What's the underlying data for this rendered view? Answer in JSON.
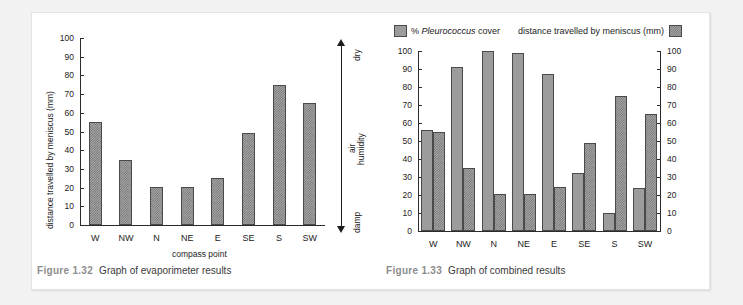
{
  "page": {
    "background_color": "#f2f2f2",
    "card_color": "#ffffff"
  },
  "figures": [
    {
      "id": "figure-1-32",
      "caption_number": "Figure 1.32",
      "caption_text": "Graph of evaporimeter results",
      "humidity_scale": {
        "top_label": "dry",
        "middle_label_line1": "air",
        "middle_label_line2": "humidity",
        "bottom_label": "damp"
      }
    },
    {
      "id": "figure-1-33",
      "caption_number": "Figure 1.33",
      "caption_text": "Graph of combined results",
      "legend": [
        {
          "label_prefix": "% ",
          "label_italic": "Pleurococcus",
          "label_suffix": " cover",
          "swatch": "solid",
          "color": "#9c9c9c"
        },
        {
          "label_prefix": "distance travelled by meniscus (mm)",
          "label_italic": "",
          "label_suffix": "",
          "swatch": "dotted",
          "color": "#a8a8a8"
        }
      ]
    }
  ],
  "chart_data": [
    {
      "type": "bar",
      "id": "evaporimeter-results",
      "title": "Graph of evaporimeter results",
      "xlabel": "compass point",
      "ylabel": "distance travelled by meniscus (mm)",
      "categories": [
        "W",
        "NW",
        "N",
        "NE",
        "E",
        "SE",
        "S",
        "SW"
      ],
      "values": [
        55,
        35,
        20.5,
        20.5,
        25,
        49,
        75,
        65
      ],
      "yticks": [
        0,
        10,
        20,
        30,
        40,
        50,
        60,
        70,
        80,
        90,
        100
      ],
      "ylim": [
        0,
        100
      ],
      "grid": false,
      "legend_position": "none",
      "bar_style": "dotted",
      "annotation": "vertical double arrow: dry (top) / air humidity (middle) / damp (bottom)"
    },
    {
      "type": "bar",
      "id": "combined-results",
      "title": "Graph of combined results",
      "xlabel": "",
      "ylabel": "",
      "ylabel_right": "",
      "categories": [
        "W",
        "NW",
        "N",
        "NE",
        "E",
        "SE",
        "S",
        "SW"
      ],
      "series": [
        {
          "name": "% Pleurococcus cover",
          "style": "solid",
          "color": "#9c9c9c",
          "axis": "left",
          "values": [
            56,
            91,
            100,
            99,
            87,
            32,
            10,
            24
          ]
        },
        {
          "name": "distance travelled by meniscus (mm)",
          "style": "dotted",
          "color": "#a8a8a8",
          "axis": "right",
          "values": [
            55,
            35,
            20.5,
            20.5,
            24.5,
            49,
            75,
            65
          ]
        }
      ],
      "yticks": [
        0,
        10,
        20,
        30,
        40,
        50,
        60,
        70,
        80,
        90,
        100
      ],
      "yticks_right": [
        0,
        10,
        20,
        30,
        40,
        50,
        60,
        70,
        80,
        90,
        100
      ],
      "ylim": [
        0,
        100
      ],
      "ylim_right": [
        0,
        100
      ],
      "grid": false,
      "legend_position": "top"
    }
  ]
}
